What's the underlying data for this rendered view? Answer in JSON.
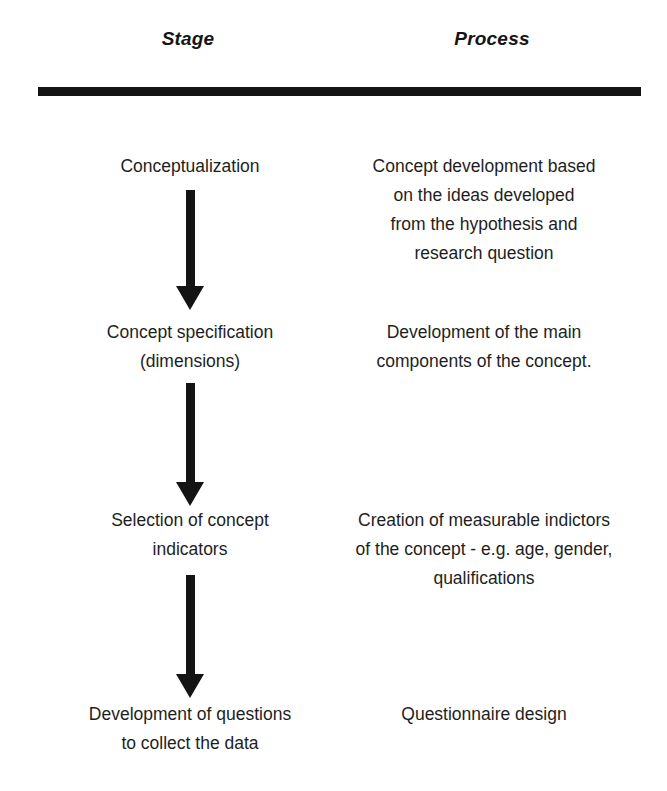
{
  "figure": {
    "columns": [
      {
        "id": "stage",
        "header": "Stage"
      },
      {
        "id": "process",
        "header": "Process"
      }
    ],
    "rule_color": "#141414",
    "arrow_color": "#141414",
    "text_color": "#1e1e1e"
  },
  "rows": [
    {
      "stage": {
        "lines": [
          "Conceptualization"
        ]
      },
      "process": {
        "lines": [
          "Concept development based",
          "on the ideas developed",
          "from the hypothesis and",
          "research question"
        ]
      },
      "arrow_after": true
    },
    {
      "stage": {
        "lines": [
          "Concept specification",
          "(dimensions)"
        ]
      },
      "process": {
        "lines": [
          "Development of the main",
          "components of the concept."
        ]
      },
      "arrow_after": true
    },
    {
      "stage": {
        "lines": [
          "Selection of concept",
          "indicators"
        ]
      },
      "process": {
        "lines": [
          "Creation of measurable indictors",
          "of the concept - e.g. age, gender,",
          "qualifications"
        ]
      },
      "arrow_after": true
    },
    {
      "stage": {
        "lines": [
          "Development of questions",
          "to collect the data"
        ]
      },
      "process": {
        "lines": [
          "Questionnaire design"
        ]
      },
      "arrow_after": false
    }
  ],
  "arrows": [
    {
      "label": "flow-arrow-conceptualization-to-specification"
    },
    {
      "label": "flow-arrow-specification-to-indicators"
    },
    {
      "label": "flow-arrow-indicators-to-questions"
    }
  ]
}
